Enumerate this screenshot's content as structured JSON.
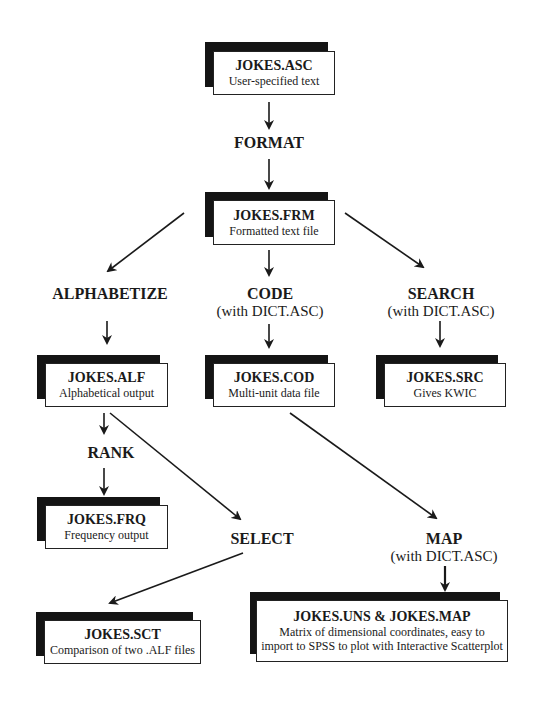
{
  "diagram": {
    "files": [
      {
        "id": "asc",
        "title": "JOKES.ASC",
        "subtitle": "User-specified text"
      },
      {
        "id": "frm",
        "title": "JOKES.FRM",
        "subtitle": "Formatted text file"
      },
      {
        "id": "alf",
        "title": "JOKES.ALF",
        "subtitle": "Alphabetical output"
      },
      {
        "id": "cod",
        "title": "JOKES.COD",
        "subtitle": "Multi-unit data file"
      },
      {
        "id": "src",
        "title": "JOKES.SRC",
        "subtitle": "Gives KWIC"
      },
      {
        "id": "frq",
        "title": "JOKES.FRQ",
        "subtitle": "Frequency output"
      },
      {
        "id": "sct",
        "title": "JOKES.SCT",
        "subtitle": "Comparison of two .ALF files"
      },
      {
        "id": "map",
        "title": "JOKES.UNS & JOKES.MAP",
        "subtitle": "Matrix of dimensional coordinates, easy to",
        "subtitle2": "import to SPSS to plot with Interactive Scatterplot"
      }
    ],
    "processes": [
      {
        "id": "format",
        "name": "FORMAT",
        "note": ""
      },
      {
        "id": "alphabetize",
        "name": "ALPHABETIZE",
        "note": ""
      },
      {
        "id": "code",
        "name": "CODE",
        "note": "(with DICT.ASC)"
      },
      {
        "id": "search",
        "name": "SEARCH",
        "note": "(with DICT.ASC)"
      },
      {
        "id": "rank",
        "name": "RANK",
        "note": ""
      },
      {
        "id": "select",
        "name": "SELECT",
        "note": ""
      },
      {
        "id": "map",
        "name": "MAP",
        "note": "(with DICT.ASC)"
      }
    ],
    "edges": [
      [
        "JOKES.ASC",
        "FORMAT"
      ],
      [
        "FORMAT",
        "JOKES.FRM"
      ],
      [
        "JOKES.FRM",
        "ALPHABETIZE"
      ],
      [
        "JOKES.FRM",
        "CODE"
      ],
      [
        "JOKES.FRM",
        "SEARCH"
      ],
      [
        "ALPHABETIZE",
        "JOKES.ALF"
      ],
      [
        "CODE",
        "JOKES.COD"
      ],
      [
        "SEARCH",
        "JOKES.SRC"
      ],
      [
        "JOKES.ALF",
        "RANK"
      ],
      [
        "RANK",
        "JOKES.FRQ"
      ],
      [
        "JOKES.ALF",
        "SELECT"
      ],
      [
        "SELECT",
        "JOKES.SCT"
      ],
      [
        "JOKES.COD",
        "MAP"
      ],
      [
        "MAP",
        "JOKES.UNS & JOKES.MAP"
      ]
    ]
  }
}
